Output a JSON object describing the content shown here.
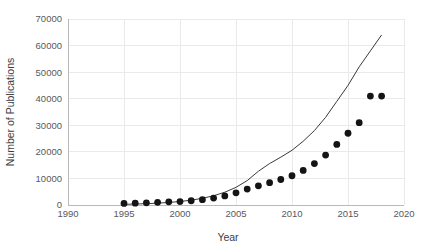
{
  "chart_data": {
    "type": "scatter",
    "title": "",
    "xlabel": "Year",
    "ylabel": "Number of Publications",
    "xlim": [
      1990,
      2020
    ],
    "ylim": [
      0,
      70000
    ],
    "grid": true,
    "legend": "none",
    "x_ticks": [
      1990,
      1995,
      2000,
      2005,
      2010,
      2015,
      2020
    ],
    "x_tick_labels": [
      "1990",
      "1995",
      "2000",
      "2005",
      "2010",
      "2015",
      "2020"
    ],
    "y_ticks": [
      0,
      10000,
      20000,
      30000,
      40000,
      50000,
      60000,
      70000
    ],
    "y_tick_labels": [
      "0",
      "10000",
      "20000",
      "30000",
      "40000",
      "50000",
      "60000",
      "70000"
    ],
    "series": [
      {
        "name": "Publications per year",
        "kind": "scatter",
        "marker": "filled-circle",
        "color": "#141414",
        "x": [
          1995,
          1996,
          1997,
          1998,
          1999,
          2000,
          2001,
          2002,
          2003,
          2004,
          2005,
          2006,
          2007,
          2008,
          2009,
          2010,
          2011,
          2012,
          2013,
          2014,
          2015,
          2016,
          2017,
          2018
        ],
        "y": [
          600,
          700,
          800,
          1000,
          1200,
          1300,
          1600,
          2000,
          2600,
          3400,
          4600,
          6000,
          7200,
          8400,
          9600,
          11000,
          13000,
          15600,
          18800,
          22800,
          27000,
          31000,
          41000,
          41000
        ]
      },
      {
        "name": "Exponential fit",
        "kind": "line",
        "color": "#3a3a3a",
        "x": [
          1995,
          1996,
          1997,
          1998,
          1999,
          2000,
          2001,
          2002,
          2003,
          2004,
          2005,
          2006,
          2007,
          2008,
          2009,
          2010,
          2011,
          2012,
          2013,
          2014,
          2015,
          2016,
          2017,
          2018
        ],
        "y": [
          260,
          360,
          500,
          690,
          950,
          1320,
          1820,
          2520,
          3480,
          4810,
          6650,
          9190,
          12700,
          15600,
          18000,
          20600,
          24000,
          28000,
          33000,
          39000,
          45000,
          52000,
          58000,
          64000
        ]
      }
    ],
    "colors": {
      "point": "#141414",
      "curve": "#3a3a3a",
      "grid": "#eaeaea",
      "axis": "#b9b9b9",
      "text": "#58595b",
      "background": "#ffffff"
    }
  }
}
